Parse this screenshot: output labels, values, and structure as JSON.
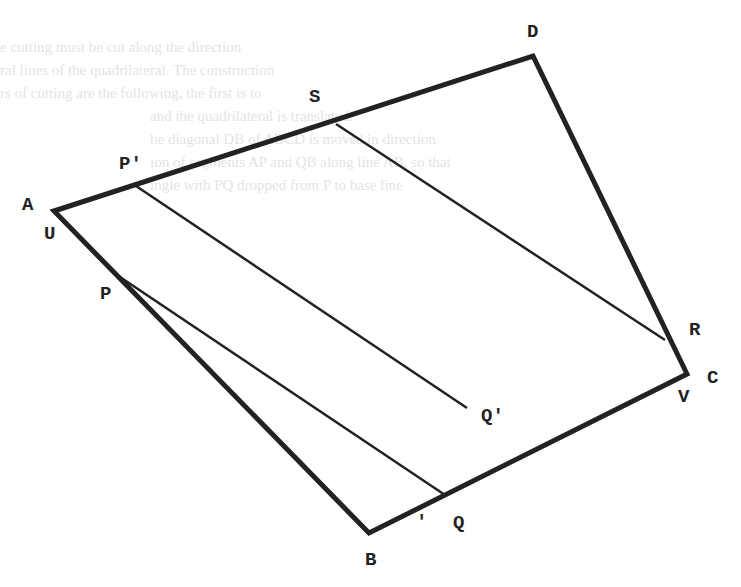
{
  "background_text": [
    "e cutting must be cut along the direction",
    "ral lines of the quadrilateral. The construction",
    "rs of cutting are the following, the first is to",
    "and the quadrilateral is translated.",
    "he diagonal DB of ABCD is moved in direction",
    "ion of segments AP and QB along line AB, so that",
    "ingle with PQ dropped from P to base line"
  ],
  "diagram": {
    "colors": {
      "stroke": "#222222",
      "background": "#ffffff"
    },
    "vertices": {
      "A": {
        "x": 54,
        "y": 211
      },
      "B": {
        "x": 369,
        "y": 533
      },
      "C": {
        "x": 687,
        "y": 374
      },
      "D": {
        "x": 533,
        "y": 56
      }
    },
    "points": {
      "P_prime": {
        "x": 136,
        "y": 186
      },
      "S": {
        "x": 336,
        "y": 124
      },
      "P": {
        "x": 117,
        "y": 275
      },
      "R": {
        "x": 665,
        "y": 340
      },
      "Q": {
        "x": 445,
        "y": 495
      },
      "Q_prime": {
        "x": 467,
        "y": 408
      }
    },
    "labels": {
      "D": "D",
      "S": "S",
      "P_prime": "P'",
      "A": "A",
      "U": "U",
      "P": "P",
      "R": "R",
      "C": "C",
      "V": "V",
      "Q_prime": "Q'",
      "Q": "Q",
      "tick": "'",
      "B": "B"
    }
  }
}
